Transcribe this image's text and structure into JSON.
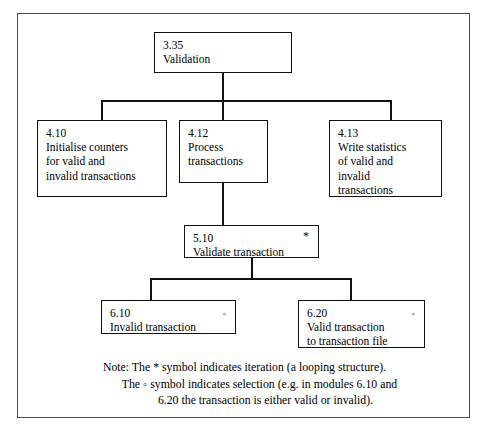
{
  "diagram": {
    "symbols": {
      "iteration": "*",
      "selection": "◦"
    },
    "nodes": [
      {
        "key": "n335",
        "id": "3.35",
        "label": "Validation",
        "marker": "",
        "level": 1
      },
      {
        "key": "n410",
        "id": "4.10",
        "label": "Initialise counters\nfor valid and\ninvalid transactions",
        "marker": "",
        "level": 2
      },
      {
        "key": "n412",
        "id": "4.12",
        "label": "Process\ntransactions",
        "marker": "",
        "level": 2
      },
      {
        "key": "n413",
        "id": "4.13",
        "label": "Write statistics\nof valid and\ninvalid\ntransactions",
        "marker": "",
        "level": 2
      },
      {
        "key": "n510",
        "id": "5.10",
        "label": "Validate transaction",
        "marker": "*",
        "level": 3
      },
      {
        "key": "n610",
        "id": "6.10",
        "label": "Invalid transaction",
        "marker": "◦",
        "level": 4
      },
      {
        "key": "n620",
        "id": "6.20",
        "label": "Valid transaction\nto transaction file",
        "marker": "◦",
        "level": 4
      }
    ],
    "note": {
      "line1": "Note: The * symbol indicates iteration (a looping structure).",
      "line2": "The ◦ symbol indicates selection (e.g. in modules 6.10 and",
      "line3": "6.20 the transaction is either valid or invalid)."
    }
  }
}
